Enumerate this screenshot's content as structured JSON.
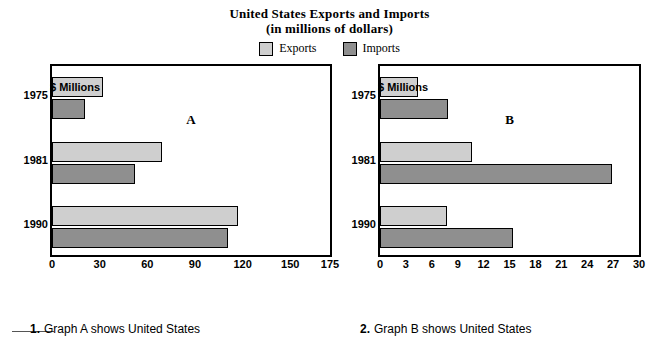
{
  "title": {
    "line1": "United States Exports and Imports",
    "line2": "(in millions of dollars)"
  },
  "legend": {
    "items": [
      {
        "label": "Exports",
        "color": "#cfcfcf"
      },
      {
        "label": "Imports",
        "color": "#8f8f8f"
      }
    ]
  },
  "questions": [
    {
      "number": "1.",
      "text": "Graph A shows United States"
    },
    {
      "number": "2.",
      "text": "Graph B shows United States"
    }
  ],
  "chart_data": [
    {
      "id": "A",
      "type": "bar",
      "orientation": "horizontal",
      "title": "United States Exports and Imports",
      "subtitle": "(in millions of dollars)",
      "caption": "A",
      "xlabel": "$ Millions",
      "ylabel": "",
      "categories": [
        "1975",
        "1981",
        "1990"
      ],
      "series": [
        {
          "name": "Exports",
          "color": "#cfcfcf",
          "values": [
            32,
            69,
            117
          ]
        },
        {
          "name": "Imports",
          "color": "#8f8f8f",
          "values": [
            21,
            52,
            111
          ]
        }
      ],
      "xlim": [
        0,
        175
      ],
      "xticks": [
        0,
        30,
        60,
        90,
        120,
        150,
        175
      ],
      "grid": false,
      "legend_position": "top"
    },
    {
      "id": "B",
      "type": "bar",
      "orientation": "horizontal",
      "caption": "B",
      "xlabel": "$ Millions",
      "ylabel": "",
      "categories": [
        "1975",
        "1981",
        "1990"
      ],
      "series": [
        {
          "name": "Exports",
          "color": "#cfcfcf",
          "values": [
            4.4,
            10.7,
            7.8
          ]
        },
        {
          "name": "Imports",
          "color": "#8f8f8f",
          "values": [
            7.9,
            26.9,
            15.4
          ]
        }
      ],
      "xlim": [
        0,
        30
      ],
      "xticks": [
        0,
        3,
        6,
        9,
        12,
        15,
        18,
        21,
        24,
        27,
        30
      ],
      "grid": false,
      "legend_position": "top"
    }
  ]
}
